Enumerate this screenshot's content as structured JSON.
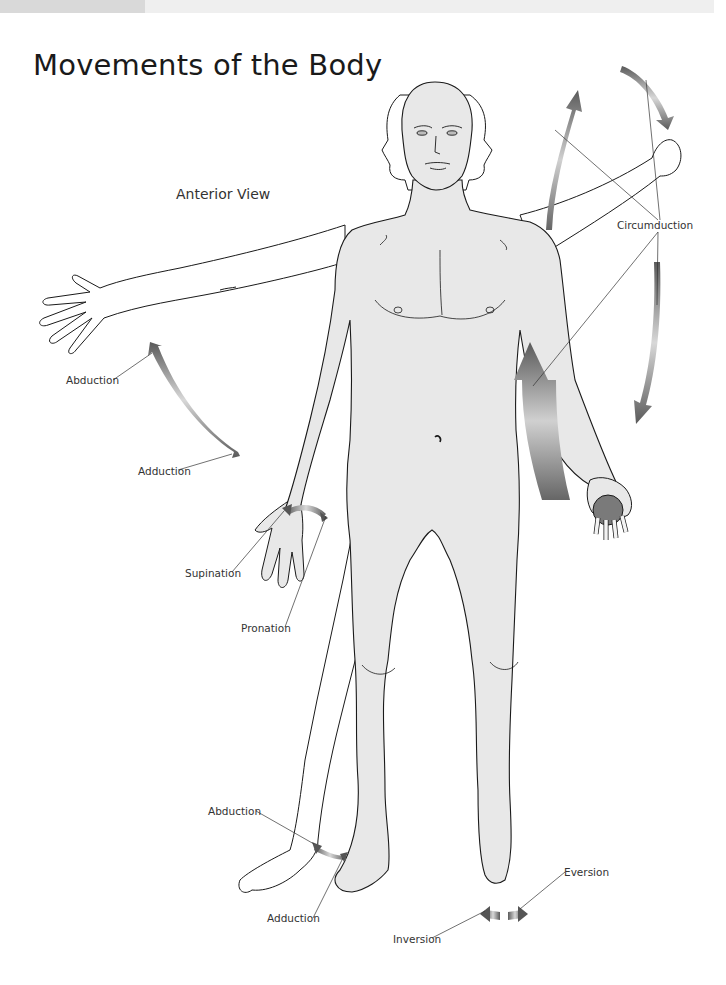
{
  "header": {
    "title": "Movements of the Body",
    "view": "Anterior View"
  },
  "colors": {
    "skin": "#e8e8e8",
    "outline": "#1a1a1a",
    "arrow_dark": "#555555",
    "arrow_light": "#d4d4d4",
    "ball": "#7a7a7a",
    "top_bar": "#efefef",
    "top_bar_tab": "#d9d9d9"
  },
  "labels": {
    "circumduction": "Circumduction",
    "arm_abduction": "Abduction",
    "arm_adduction": "Adduction",
    "supination": "Supination",
    "pronation": "Pronation",
    "leg_abduction": "Abduction",
    "leg_adduction": "Adduction",
    "inversion": "Inversion",
    "eversion": "Eversion"
  }
}
